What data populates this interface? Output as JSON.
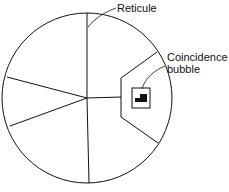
{
  "labels": {
    "reticule": "Reticule",
    "coincidence_line1": "Coincidence",
    "coincidence_line2": "bubble"
  },
  "colors": {
    "stroke": "#111111",
    "background": "#ffffff"
  }
}
